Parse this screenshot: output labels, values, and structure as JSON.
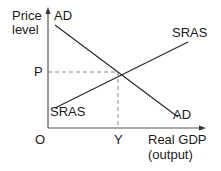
{
  "diagram": {
    "type": "AD-SRAS macroeconomic equilibrium",
    "y_axis_label_line1": "Price",
    "y_axis_label_line2": "level",
    "x_axis_label_line1": "Real GDP",
    "x_axis_label_line2": "(output)",
    "origin_label": "O",
    "price_label": "P",
    "output_label": "Y",
    "curves": {
      "ad_top_label": "AD",
      "ad_bottom_label": "AD",
      "sras_top_label": "SRAS",
      "sras_bottom_label": "SRAS"
    },
    "colors": {
      "line": "#2a2a2a",
      "dashed": "#888888",
      "text": "#1a1a1a"
    }
  }
}
